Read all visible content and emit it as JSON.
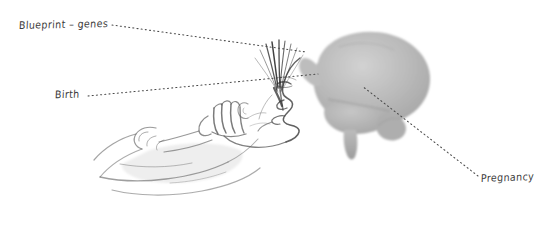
{
  "figure": {
    "background_color": "#ffffff",
    "width": 555,
    "height": 234,
    "style": "pencil sketch illustration with gray brain silhouette and dotted leader lines",
    "text_color": "#3a3a3a",
    "brain_color": "#b9b9b9",
    "brain_shadow_color": "#9a9a9a",
    "sketch_color": "#555555",
    "leader_color": "#4a4a4a"
  },
  "labels": [
    {
      "id": "blueprint",
      "text": "Blueprint – genes"
    },
    {
      "id": "birth",
      "text": "Birth"
    },
    {
      "id": "pregnancy",
      "text": "Pregnancy"
    }
  ],
  "leader_lines": [
    {
      "from_label": "blueprint",
      "x1": 112,
      "y1": 25,
      "x2": 306,
      "y2": 52
    },
    {
      "from_label": "birth",
      "x1": 88,
      "y1": 96,
      "x2": 318,
      "y2": 74
    },
    {
      "from_label": "pregnancy",
      "x1": 478,
      "y1": 176,
      "x2": 362,
      "y2": 86
    }
  ],
  "illustration_parts": [
    {
      "name": "brain-silhouette"
    },
    {
      "name": "infant-face-profile-sketch"
    },
    {
      "name": "hand-and-arm-sketch"
    },
    {
      "name": "hair-strokes-sketch"
    }
  ]
}
